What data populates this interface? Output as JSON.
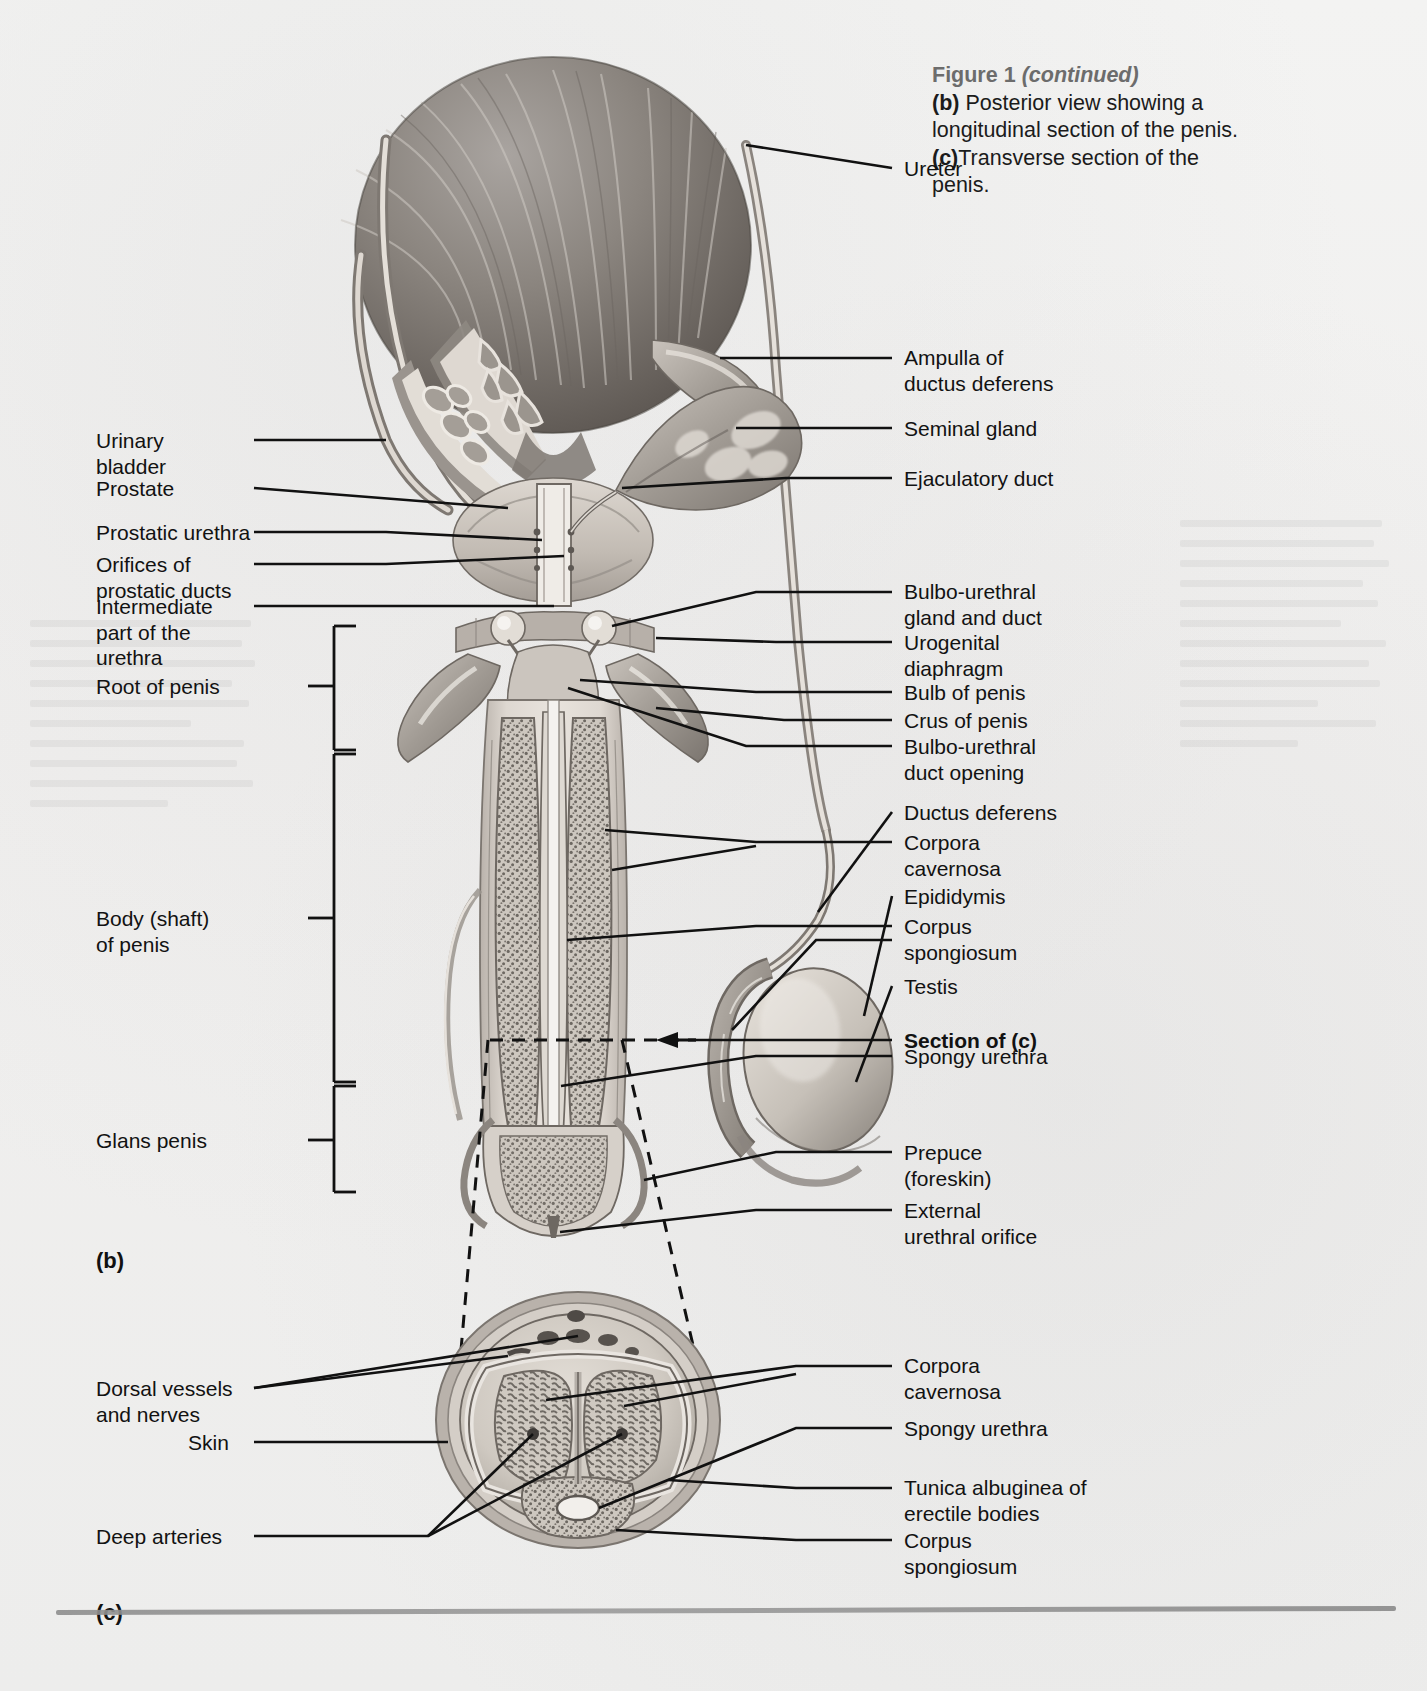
{
  "caption": {
    "figure_label": "Figure 1",
    "continued": "(continued)",
    "part_b_tag": "(b)",
    "part_b_text": " Posterior view showing a longitudinal section of the penis.",
    "part_c_tag": "(c)",
    "part_c_text": "Transverse section of the penis."
  },
  "panels": {
    "b": "(b)",
    "c": "(c)"
  },
  "labels_right_b": [
    {
      "name": "ureter",
      "text": "Ureter"
    },
    {
      "name": "ampulla-of-ductus-deferens",
      "text": "Ampulla of\nductus deferens"
    },
    {
      "name": "seminal-gland",
      "text": "Seminal gland"
    },
    {
      "name": "ejaculatory-duct",
      "text": "Ejaculatory duct"
    },
    {
      "name": "bulbo-urethral-gland-and-duct",
      "text": "Bulbo-urethral\ngland and duct"
    },
    {
      "name": "urogenital-diaphragm",
      "text": "Urogenital\ndiaphragm"
    },
    {
      "name": "bulb-of-penis",
      "text": "Bulb of penis"
    },
    {
      "name": "crus-of-penis",
      "text": "Crus of penis"
    },
    {
      "name": "bulbo-urethral-duct-opening",
      "text": "Bulbo-urethral\nduct opening"
    },
    {
      "name": "ductus-deferens",
      "text": "Ductus deferens"
    },
    {
      "name": "corpora-cavernosa",
      "text": "Corpora\ncavernosa"
    },
    {
      "name": "epididymis",
      "text": "Epididymis"
    },
    {
      "name": "corpus-spongiosum",
      "text": "Corpus\nspongiosum"
    },
    {
      "name": "testis",
      "text": "Testis"
    },
    {
      "name": "section-of-c",
      "text": "Section of (c)"
    },
    {
      "name": "spongy-urethra",
      "text": "Spongy urethra"
    },
    {
      "name": "prepuce-foreskin",
      "text": "Prepuce\n(foreskin)"
    },
    {
      "name": "external-urethral-orifice",
      "text": "External\nurethral orifice"
    }
  ],
  "labels_left_b": [
    {
      "name": "urinary-bladder",
      "text": "Urinary\nbladder"
    },
    {
      "name": "prostate",
      "text": "Prostate"
    },
    {
      "name": "prostatic-urethra",
      "text": "Prostatic urethra"
    },
    {
      "name": "orifices-of-prostatic-ducts",
      "text": "Orifices of\nprostatic ducts"
    },
    {
      "name": "intermediate-part-of-the-urethra",
      "text": "Intermediate\npart of the\nurethra"
    },
    {
      "name": "root-of-penis",
      "text": "Root of penis"
    },
    {
      "name": "body-shaft-of-penis",
      "text": "Body (shaft)\nof penis"
    },
    {
      "name": "glans-penis",
      "text": "Glans penis"
    }
  ],
  "labels_left_c": [
    {
      "name": "dorsal-vessels-and-nerves",
      "text": "Dorsal vessels\nand nerves"
    },
    {
      "name": "skin",
      "text": "Skin"
    },
    {
      "name": "deep-arteries",
      "text": "Deep arteries"
    }
  ],
  "labels_right_c": [
    {
      "name": "corpora-cavernosa",
      "text": "Corpora\ncavernosa"
    },
    {
      "name": "spongy-urethra",
      "text": "Spongy urethra"
    },
    {
      "name": "tunica-albuginea-of-erectile-bodies",
      "text": "Tunica albuginea of\nerectile bodies"
    },
    {
      "name": "corpus-spongiosum",
      "text": "Corpus\nspongiosum"
    }
  ],
  "colors": {
    "ink": "#121212",
    "caption_gray": "#6c6c6c",
    "paper": "#f1f0ef",
    "rule": "#8e8e8e",
    "tissue_dark": "#6f6a66",
    "tissue_mid": "#9b9691",
    "tissue_light": "#cfcac4"
  }
}
